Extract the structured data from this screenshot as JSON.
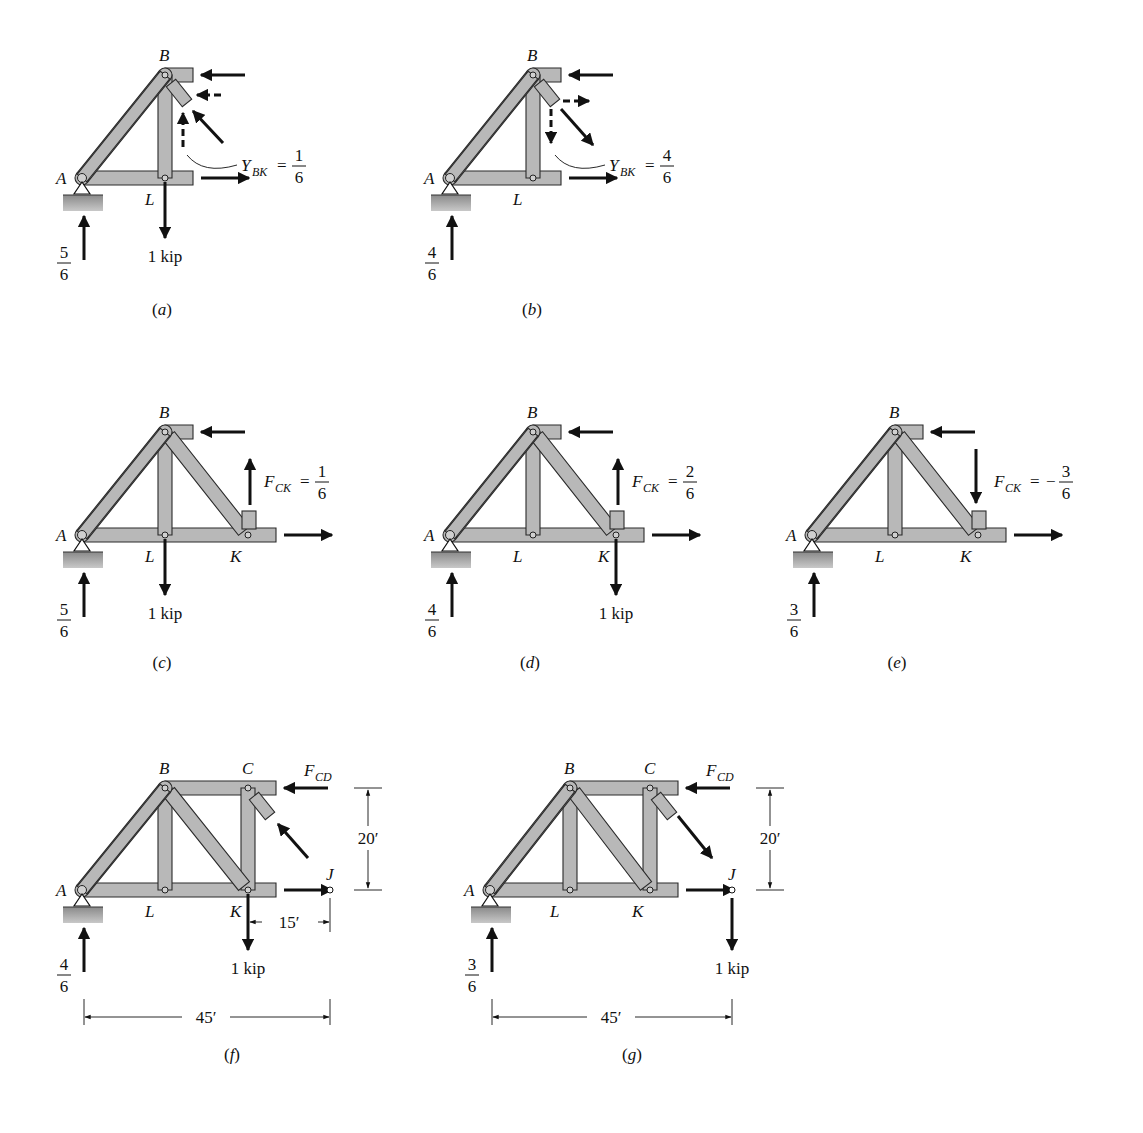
{
  "figure": {
    "panels": [
      {
        "id": "a",
        "caption": "(a)",
        "nodes": {
          "A": "A",
          "B": "B",
          "L": "L"
        },
        "support_reaction": {
          "num": "5",
          "den": "6"
        },
        "load": {
          "label": "1 kip",
          "at": "L"
        },
        "annotation": {
          "symbol": "Y",
          "subscript": "BK",
          "eq": "=",
          "sign": "",
          "num": "1",
          "den": "6"
        },
        "dashed_components": "up-left"
      },
      {
        "id": "b",
        "caption": "(b)",
        "nodes": {
          "A": "A",
          "B": "B",
          "L": "L"
        },
        "support_reaction": {
          "num": "4",
          "den": "6"
        },
        "load": null,
        "annotation": {
          "symbol": "Y",
          "subscript": "BK",
          "eq": "=",
          "sign": "",
          "num": "4",
          "den": "6"
        },
        "dashed_components": "down-right"
      },
      {
        "id": "c",
        "caption": "(c)",
        "nodes": {
          "A": "A",
          "B": "B",
          "L": "L",
          "K": "K"
        },
        "support_reaction": {
          "num": "5",
          "den": "6"
        },
        "load": {
          "label": "1 kip",
          "at": "L"
        },
        "annotation": {
          "symbol": "F",
          "subscript": "CK",
          "eq": "=",
          "sign": "",
          "num": "1",
          "den": "6"
        },
        "ck_direction": "up"
      },
      {
        "id": "d",
        "caption": "(d)",
        "nodes": {
          "A": "A",
          "B": "B",
          "L": "L",
          "K": "K"
        },
        "support_reaction": {
          "num": "4",
          "den": "6"
        },
        "load": {
          "label": "1 kip",
          "at": "K"
        },
        "annotation": {
          "symbol": "F",
          "subscript": "CK",
          "eq": "=",
          "sign": "",
          "num": "2",
          "den": "6"
        },
        "ck_direction": "up"
      },
      {
        "id": "e",
        "caption": "(e)",
        "nodes": {
          "A": "A",
          "B": "B",
          "L": "L",
          "K": "K"
        },
        "support_reaction": {
          "num": "3",
          "den": "6"
        },
        "load": null,
        "annotation": {
          "symbol": "F",
          "subscript": "CK",
          "eq": "=",
          "sign": "−",
          "num": "3",
          "den": "6"
        },
        "ck_direction": "down"
      },
      {
        "id": "f",
        "caption": "(f)",
        "nodes": {
          "A": "A",
          "B": "B",
          "C": "C",
          "L": "L",
          "K": "K",
          "J": "J"
        },
        "support_reaction": {
          "num": "4",
          "den": "6"
        },
        "load": {
          "label": "1 kip",
          "at": "K"
        },
        "force_label": {
          "symbol": "F",
          "subscript": "CD"
        },
        "dims": {
          "height": "20′",
          "kj": "15′",
          "span": "45′"
        },
        "diag_direction": "up-left"
      },
      {
        "id": "g",
        "caption": "(g)",
        "nodes": {
          "A": "A",
          "B": "B",
          "C": "C",
          "L": "L",
          "K": "K",
          "J": "J"
        },
        "support_reaction": {
          "num": "3",
          "den": "6"
        },
        "load": {
          "label": "1 kip",
          "at": "J"
        },
        "force_label": {
          "symbol": "F",
          "subscript": "CD"
        },
        "dims": {
          "height": "20′",
          "span": "45′"
        },
        "diag_direction": "down-right"
      }
    ]
  }
}
